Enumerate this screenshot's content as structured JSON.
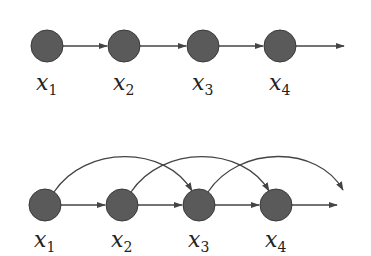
{
  "diagram": {
    "type": "graphical-model",
    "colors": {
      "node_fill": "#5a5a5a",
      "edge": "#444444",
      "label": "#222222"
    },
    "top": {
      "name": "first-order chain",
      "nodes": [
        {
          "id": "x1",
          "var": "x",
          "sub": "1"
        },
        {
          "id": "x2",
          "var": "x",
          "sub": "2"
        },
        {
          "id": "x3",
          "var": "x",
          "sub": "3"
        },
        {
          "id": "x4",
          "var": "x",
          "sub": "4"
        }
      ],
      "edges": [
        [
          "x1",
          "x2"
        ],
        [
          "x2",
          "x3"
        ],
        [
          "x3",
          "x4"
        ],
        [
          "x4",
          "..."
        ]
      ]
    },
    "bottom": {
      "name": "second-order chain",
      "nodes": [
        {
          "id": "x1",
          "var": "x",
          "sub": "1"
        },
        {
          "id": "x2",
          "var": "x",
          "sub": "2"
        },
        {
          "id": "x3",
          "var": "x",
          "sub": "3"
        },
        {
          "id": "x4",
          "var": "x",
          "sub": "4"
        }
      ],
      "edges": [
        [
          "x1",
          "x2"
        ],
        [
          "x2",
          "x3"
        ],
        [
          "x3",
          "x4"
        ],
        [
          "x4",
          "..."
        ],
        [
          "x1",
          "x3"
        ],
        [
          "x2",
          "x4"
        ],
        [
          "x3",
          "..."
        ]
      ]
    }
  }
}
